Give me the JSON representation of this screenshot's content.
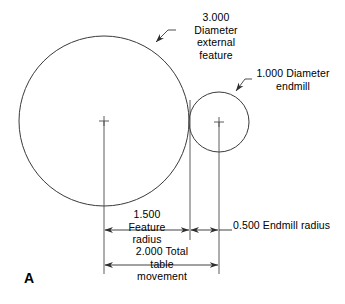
{
  "figure": {
    "panel_letter": "A",
    "background_color": "#ffffff",
    "line_color": "#3a3a3a",
    "text_color": "#000000",
    "width": 345,
    "height": 304
  },
  "annotations": {
    "external_feature": {
      "text": "3.000\nDiameter\nexternal\nfeature",
      "value": "3.000",
      "descriptor": "Diameter external feature"
    },
    "endmill": {
      "text": "1.000 Diameter\nendmill",
      "value": "1.000",
      "descriptor": "Diameter endmill"
    }
  },
  "dimensions": [
    {
      "name": "feature-radius",
      "text": "1.500\nFeature\nradius",
      "value": "1.500",
      "descriptor": "Feature radius"
    },
    {
      "name": "endmill-radius",
      "text": "0.500 Endmill radius",
      "value": "0.500",
      "descriptor": "Endmill radius"
    },
    {
      "name": "table-movement",
      "text": "2.000 Total\ntable\nmovement",
      "value": "2.000",
      "descriptor": "Total table movement"
    }
  ],
  "geometry": {
    "external_feature_circle": {
      "cx": 104,
      "cy": 121,
      "r": 85
    },
    "endmill_circle": {
      "cx": 219,
      "cy": 122,
      "r": 30
    },
    "tangency_x": 190
  }
}
